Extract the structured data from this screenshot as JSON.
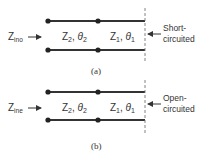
{
  "figures": [
    {
      "id": "a",
      "caption": "(a)",
      "input_label": {
        "main": "Z",
        "sub": "ino"
      },
      "section2": {
        "z": "Z",
        "z_sub": "2",
        "theta": "θ",
        "theta_sub": "2"
      },
      "section1": {
        "z": "Z",
        "z_sub": "1",
        "theta": "θ",
        "theta_sub": "1"
      },
      "termination_line1": "Short-",
      "termination_line2": "circuited"
    },
    {
      "id": "b",
      "caption": "(b)",
      "input_label": {
        "main": "Z",
        "sub": "ine"
      },
      "section2": {
        "z": "Z",
        "z_sub": "2",
        "theta": "θ",
        "theta_sub": "2"
      },
      "section1": {
        "z": "Z",
        "z_sub": "1",
        "theta": "θ",
        "theta_sub": "1"
      },
      "termination_line1": "Open-",
      "termination_line2": "circuited"
    }
  ],
  "colors": {
    "line": "#333333",
    "dashed": "#777777",
    "text": "#333333"
  }
}
